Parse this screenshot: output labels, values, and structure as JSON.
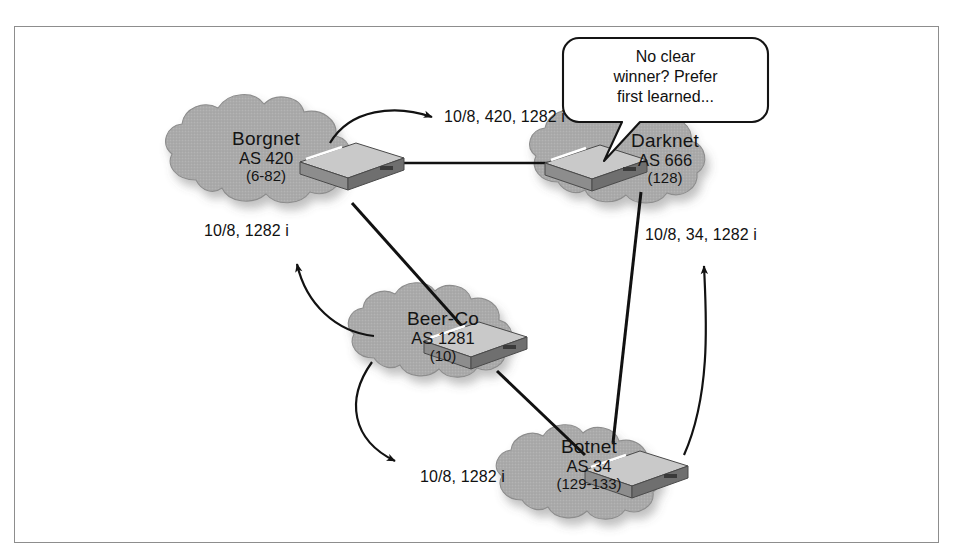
{
  "figure": {
    "border_color": "#8d8d8d",
    "background_color": "#ffffff",
    "cloud_fill": "#a9a9a9",
    "cloud_stroke": "#8f8f8f",
    "link_color": "#111111",
    "text_color": "#141414"
  },
  "clouds": [
    {
      "id": "borgnet",
      "name": "Borgnet",
      "as": "AS 420",
      "range": "(6-82)"
    },
    {
      "id": "darknet",
      "name": "Darknet",
      "as": "AS 666",
      "range": "(128)"
    },
    {
      "id": "beerco",
      "name": "Beer-Co",
      "as": "AS 1281",
      "range": "(10)"
    },
    {
      "id": "botnet",
      "name": "Botnet",
      "as": "AS 34",
      "range": "(129-133)"
    }
  ],
  "advertisements": [
    {
      "id": "adv-borgnet-to-darknet",
      "text": "10/8, 420, 1282 i"
    },
    {
      "id": "adv-beerco-to-borgnet",
      "text": "10/8, 1282 i"
    },
    {
      "id": "adv-botnet-to-darknet",
      "text": "10/8, 34, 1282 i"
    },
    {
      "id": "adv-beerco-to-botnet",
      "text": "10/8, 1282 i"
    }
  ],
  "callout": {
    "line1": "No clear",
    "line2": "winner?  Prefer",
    "line3": "first learned..."
  }
}
